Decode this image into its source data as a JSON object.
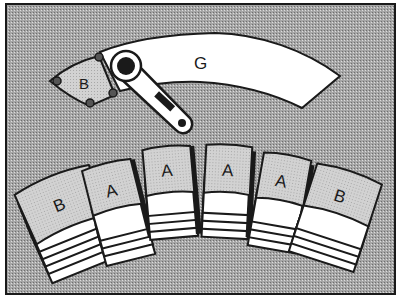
{
  "figure": {
    "background_color": "#9a9a9a",
    "frame_color": "#1a1a1a",
    "pattern_fill": "halftone-gray",
    "paper_color": "#ffffff",
    "tile_color": "#c8c8c8"
  },
  "labels": {
    "guide": "G",
    "top_piece": "B",
    "stacks": [
      "B",
      "A",
      "A",
      "A",
      "A",
      "B"
    ]
  },
  "tool": {
    "name": "rotary-cutter",
    "icon": "rotary-cutter-icon"
  }
}
